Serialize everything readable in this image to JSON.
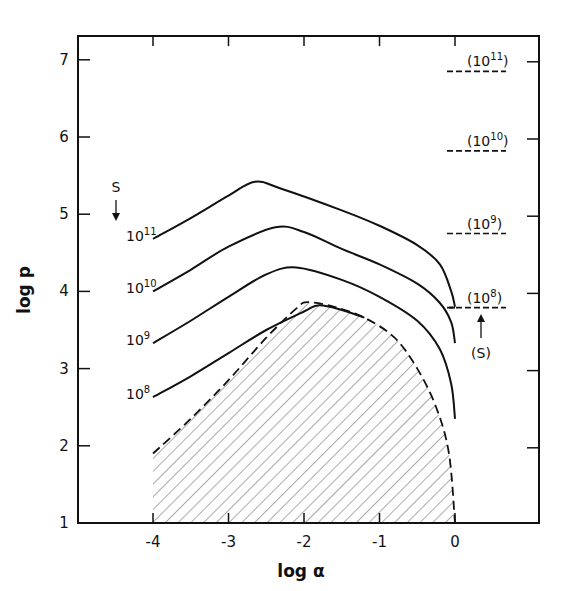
{
  "chart_data": {
    "type": "line",
    "title": "",
    "xlabel": "log α",
    "ylabel": "log p",
    "xlim": [
      -5,
      1.1
    ],
    "ylim": [
      1,
      7.3
    ],
    "xticks": [
      -4,
      -3,
      -2,
      -1,
      0
    ],
    "xtick_labels": [
      "-4",
      "-3",
      "-2",
      "-1",
      "0"
    ],
    "yticks": [
      1,
      2,
      3,
      4,
      5,
      6,
      7
    ],
    "ytick_labels": [
      "1",
      "2",
      "3",
      "4",
      "5",
      "6",
      "7"
    ],
    "grid": false,
    "legend": "none (curves labeled inline)",
    "series": [
      {
        "name": "S = 10^11",
        "label_base": "10",
        "label_exp": "11",
        "style": "solid",
        "points": [
          [
            -4.0,
            4.68
          ],
          [
            -3.5,
            4.95
          ],
          [
            -3.0,
            5.24
          ],
          [
            -2.65,
            5.42
          ],
          [
            -2.3,
            5.33
          ],
          [
            -1.5,
            5.05
          ],
          [
            -1.0,
            4.85
          ],
          [
            -0.5,
            4.6
          ],
          [
            -0.2,
            4.35
          ],
          [
            -0.05,
            4.0
          ],
          [
            0.0,
            3.8
          ]
        ]
      },
      {
        "name": "S = 10^10",
        "label_base": "10",
        "label_exp": "10",
        "style": "solid",
        "points": [
          [
            -4.0,
            4.0
          ],
          [
            -3.5,
            4.28
          ],
          [
            -3.0,
            4.58
          ],
          [
            -2.38,
            4.83
          ],
          [
            -2.0,
            4.77
          ],
          [
            -1.5,
            4.55
          ],
          [
            -1.0,
            4.35
          ],
          [
            -0.5,
            4.1
          ],
          [
            -0.2,
            3.85
          ],
          [
            -0.05,
            3.6
          ],
          [
            0.0,
            3.33
          ]
        ]
      },
      {
        "name": "S = 10^9",
        "label_base": "10",
        "label_exp": "9",
        "style": "solid",
        "points": [
          [
            -4.0,
            3.33
          ],
          [
            -3.5,
            3.62
          ],
          [
            -3.0,
            3.93
          ],
          [
            -2.5,
            4.22
          ],
          [
            -2.1,
            4.31
          ],
          [
            -1.5,
            4.15
          ],
          [
            -1.0,
            3.93
          ],
          [
            -0.5,
            3.62
          ],
          [
            -0.2,
            3.25
          ],
          [
            -0.05,
            2.8
          ],
          [
            0.0,
            2.35
          ]
        ]
      },
      {
        "name": "S = 10^8",
        "label_base": "10",
        "label_exp": "8",
        "style": "solid",
        "points": [
          [
            -4.0,
            2.63
          ],
          [
            -3.5,
            2.9
          ],
          [
            -3.0,
            3.2
          ],
          [
            -2.5,
            3.5
          ],
          [
            -2.0,
            3.74
          ],
          [
            -1.8,
            3.82
          ],
          [
            -1.5,
            3.76
          ],
          [
            -1.2,
            3.66
          ]
        ]
      },
      {
        "name": "Boundary (dashed, hatched region below)",
        "style": "dashed",
        "points": [
          [
            -4.0,
            1.9
          ],
          [
            -3.5,
            2.35
          ],
          [
            -3.0,
            2.85
          ],
          [
            -2.5,
            3.4
          ],
          [
            -2.1,
            3.78
          ],
          [
            -1.95,
            3.86
          ],
          [
            -1.6,
            3.8
          ],
          [
            -1.2,
            3.66
          ],
          [
            -0.8,
            3.4
          ],
          [
            -0.5,
            3.0
          ],
          [
            -0.25,
            2.5
          ],
          [
            -0.08,
            1.9
          ],
          [
            0.0,
            1.0
          ]
        ]
      }
    ],
    "asymptotes": [
      {
        "label_base": "10",
        "label_exp": "11",
        "log_p": 6.85
      },
      {
        "label_base": "10",
        "label_exp": "10",
        "log_p": 5.82
      },
      {
        "label_base": "10",
        "label_exp": "9",
        "log_p": 4.75
      },
      {
        "label_base": "10",
        "label_exp": "8",
        "log_p": 3.79
      }
    ],
    "annotations": [
      {
        "text": "S",
        "position": "above 10^11 curve label with down arrow",
        "x": -4.3,
        "y": 5.3
      },
      {
        "text": "(S)",
        "position": "below (10^8) asymptote with up arrow",
        "x": 0.25,
        "y": 3.2
      }
    ],
    "hatched_region": "area under dashed boundary from log α = -4 to 0"
  },
  "labels": {
    "s_top": "S",
    "s_right": "(S)",
    "xlabel": "log α",
    "ylabel": "log p"
  }
}
